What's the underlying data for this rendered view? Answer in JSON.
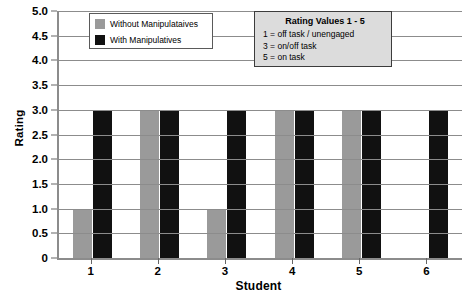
{
  "chart_data": {
    "type": "bar",
    "title": "",
    "xlabel": "Student",
    "ylabel": "Rating",
    "categories": [
      "1",
      "2",
      "3",
      "4",
      "5",
      "6"
    ],
    "series": [
      {
        "name": "Without Manipulataives",
        "color": "#9a9a9a",
        "values": [
          1.0,
          3.0,
          1.0,
          3.0,
          3.0,
          0
        ]
      },
      {
        "name": "With Manipulatives",
        "color": "#111111",
        "values": [
          3.0,
          3.0,
          3.0,
          3.0,
          3.0,
          3.0
        ]
      }
    ],
    "ylim": [
      0,
      5
    ],
    "ytick_labels": [
      "5.0",
      "4.5",
      "4.0",
      "3.5",
      "3.0",
      "2.5",
      "2.0",
      "1.5",
      "1.0",
      "0.5",
      "0"
    ],
    "ytick_values": [
      5.0,
      4.5,
      4.0,
      3.5,
      3.0,
      2.5,
      2.0,
      1.5,
      1.0,
      0.5,
      0
    ],
    "grid": true,
    "legend_position": "top-left"
  },
  "axes": {
    "y_title": "Rating",
    "x_title": "Student"
  },
  "legend": {
    "items": [
      {
        "label": "Without Manipulataives",
        "swatch": "legend-swatch-gray"
      },
      {
        "label": "With Manipulatives",
        "swatch": "legend-swatch-black"
      }
    ]
  },
  "info_box": {
    "title": "Rating Values 1 - 5",
    "lines": [
      "1 = off task / unengaged",
      "3 = on/off task",
      "5 = on task"
    ]
  },
  "colors": {
    "without_manipulatives": "#9a9a9a",
    "with_manipulatives": "#111111",
    "gridline": "#8c8c8c",
    "info_box_background": "#dcdcdc",
    "plot_background": "#ffffff"
  }
}
